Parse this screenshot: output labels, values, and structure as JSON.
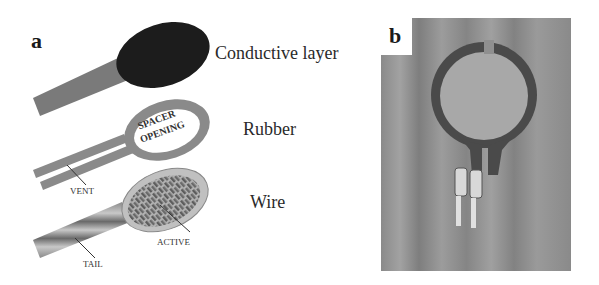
{
  "panel_a": {
    "letter": "a",
    "layers": [
      {
        "id": "conductive",
        "label": "Conductive layer"
      },
      {
        "id": "rubber",
        "label": "Rubber",
        "inner_text_line1": "SPACER",
        "inner_text_line2": "OPENING",
        "callouts": [
          "VENT"
        ]
      },
      {
        "id": "wire",
        "label": "Wire",
        "callouts": [
          "ACTIVE",
          "TAIL"
        ]
      }
    ]
  },
  "panel_b": {
    "letter": "b",
    "description": "Photograph of circular force-sensing resistor sensor with two crimped connector pins on wooden surface"
  },
  "colors": {
    "background": "#ffffff",
    "conductive_fill": "#1c1c1c",
    "tail_fill": "#7a7a7a",
    "rubber_fill": "#8a8a8a",
    "wire_fill": "#9a9a9a",
    "wood": "#8c8c8c",
    "sensor_ring": "#4a4a4a",
    "sensor_disc": "#a8a8a8"
  }
}
